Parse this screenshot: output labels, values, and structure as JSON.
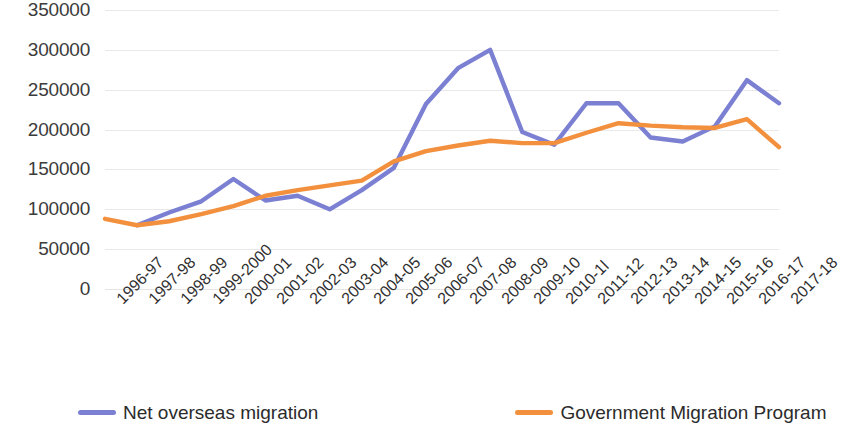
{
  "chart_data": {
    "type": "line",
    "title": "",
    "xlabel": "",
    "ylabel": "",
    "ylim": [
      0,
      350000
    ],
    "ytick_values": [
      0,
      50000,
      100000,
      150000,
      200000,
      250000,
      300000,
      350000
    ],
    "ytick_labels": [
      "0",
      "50000",
      "100000",
      "150000",
      "200000",
      "250000",
      "300000",
      "350000"
    ],
    "grid": true,
    "legend_position": "bottom",
    "categories": [
      "1996-97",
      "1997-98",
      "1998-99",
      "1999-2000",
      "2000-01",
      "2001-02",
      "2002-03",
      "2003-04",
      "2004-05",
      "2005-06",
      "2006-07",
      "2007-08",
      "2008-09",
      "2009-10",
      "2010-1l",
      "2011-12",
      "2012-13",
      "2013-14",
      "2014-15",
      "2015-16",
      "2016-17",
      "2017-18"
    ],
    "series": [
      {
        "name": "Net overseas migration",
        "color": "#7b80d2",
        "values": [
          null,
          80000,
          96000,
          110000,
          138000,
          111000,
          117000,
          100000,
          124000,
          152000,
          232000,
          277000,
          300000,
          197000,
          181000,
          233000,
          233000,
          190000,
          185000,
          204000,
          262000,
          233000
        ]
      },
      {
        "name": "Government Migration Program",
        "color": "#f2903e",
        "values": [
          88000,
          80000,
          85000,
          94000,
          104000,
          117000,
          124000,
          130000,
          136000,
          160000,
          173000,
          180000,
          186000,
          183000,
          183000,
          196000,
          208000,
          205000,
          203000,
          202000,
          213000,
          178000
        ]
      }
    ]
  },
  "legend": {
    "items": [
      {
        "label": "Net overseas migration",
        "color": "#7b80d2"
      },
      {
        "label": "Government Migration Program",
        "color": "#f2903e"
      }
    ]
  }
}
